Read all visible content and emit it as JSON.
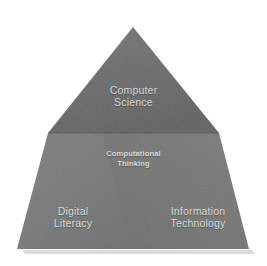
{
  "diagram": {
    "type": "pyramid",
    "background_color": "#ffffff",
    "text_color": "#d9d9d9",
    "sections": [
      {
        "id": "apex",
        "name": "computer-science",
        "line1": "Computer",
        "line2": "Science",
        "fill_color": "#6b6b6b",
        "position": "top"
      },
      {
        "id": "center",
        "name": "computational-thinking",
        "line1": "Computational",
        "line2": "Thinking",
        "fill_color": "#777777",
        "position": "center"
      },
      {
        "id": "base-left",
        "name": "digital-literacy",
        "line1": "Digital",
        "line2": "Literacy",
        "fill_color": "#787878",
        "position": "bottom-left"
      },
      {
        "id": "base-right",
        "name": "information-technology",
        "line1": "Information",
        "line2": "Technology",
        "fill_color": "#757575",
        "position": "bottom-right"
      }
    ],
    "divider_color": "#5e5e5e",
    "shadow_color": "#bfbfbf"
  }
}
